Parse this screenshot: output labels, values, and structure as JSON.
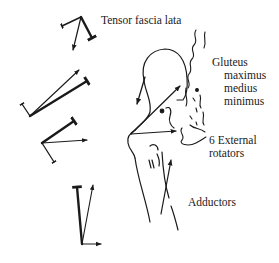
{
  "diagram": {
    "labels": {
      "tensor_fascia_lata": "Tensor fascia lata",
      "gluteus_heading": "Gluteus",
      "gluteus_maximus": "maximus",
      "gluteus_medius": "medius",
      "gluteus_minimus": "minimus",
      "external_rotators_line1": "6 External",
      "external_rotators_line2": "rotators",
      "adductors": "Adductors"
    },
    "vector_groups": [
      {
        "name": "tensor-fascia-lata",
        "components": 3
      },
      {
        "name": "gluteus",
        "components": 3
      },
      {
        "name": "external-rotators",
        "components": 3
      },
      {
        "name": "adductors",
        "components": 3
      }
    ],
    "colors": {
      "ink": "#1a1a1a",
      "background": "#ffffff"
    }
  }
}
